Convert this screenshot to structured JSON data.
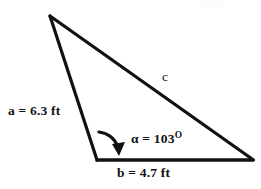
{
  "figure": {
    "type": "triangle-diagram",
    "background_color": "#ffffff",
    "stroke_color": "#111111",
    "stroke_width": 3
  },
  "geometry": {
    "vertices": {
      "apex": {
        "x": 50,
        "y": 16
      },
      "bottom_left": {
        "x": 97,
        "y": 160
      },
      "bottom_right": {
        "x": 253,
        "y": 160
      }
    },
    "sides": [
      {
        "name": "a",
        "from": "apex",
        "to": "bottom_left"
      },
      {
        "name": "b",
        "from": "bottom_left",
        "to": "bottom_right"
      },
      {
        "name": "c",
        "from": "apex",
        "to": "bottom_right"
      }
    ]
  },
  "labels": {
    "side_a": "a = 6.3 ft",
    "side_b": "b = 4.7 ft",
    "side_c": "c",
    "angle_symbol": "α = 103",
    "angle_degree_mark": "O"
  },
  "values": {
    "a_length": 6.3,
    "b_length": 4.7,
    "units": "ft",
    "alpha_degrees": 103,
    "c_length": ""
  },
  "annotations": {
    "angle_arrow": {
      "name": "curved-arrow",
      "points_to": "included angle alpha at bottom-left vertex",
      "start": {
        "x": 100,
        "y": 133
      },
      "arrowhead": {
        "x": 120,
        "y": 153
      }
    },
    "bottom_edge_text": "",
    "top_edge_mark": ""
  }
}
